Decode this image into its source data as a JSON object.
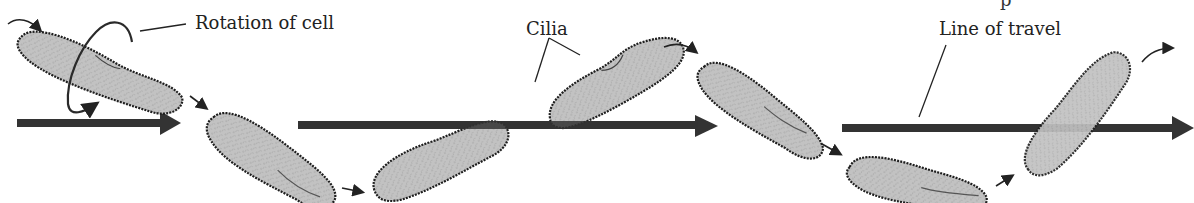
{
  "diagram": {
    "title": "",
    "labels": {
      "rotation": "Rotation of cell",
      "cilia": "Cilia",
      "travel": "Line of travel"
    },
    "truncated_top_text": "p",
    "colors": {
      "cell_fill": "#bdbdbd",
      "cell_outline": "#1e1e1e",
      "arrow": "#333333",
      "background": "#ffffff",
      "text": "#222222"
    },
    "cells": [
      {
        "id": 1,
        "cx": 100,
        "cy": 72,
        "rx": 88,
        "ry": 22,
        "angle": 20
      },
      {
        "id": 2,
        "cx": 272,
        "cy": 160,
        "rx": 72,
        "ry": 25,
        "angle": 30
      },
      {
        "id": 3,
        "cx": 440,
        "cy": 160,
        "rx": 72,
        "ry": 24,
        "angle": -20
      },
      {
        "id": 4,
        "cx": 615,
        "cy": 82,
        "rx": 75,
        "ry": 24,
        "angle": -23
      },
      {
        "id": 5,
        "cx": 762,
        "cy": 110,
        "rx": 72,
        "ry": 24,
        "angle": 32
      },
      {
        "id": 6,
        "cx": 918,
        "cy": 183,
        "rx": 70,
        "ry": 22,
        "angle": 10
      },
      {
        "id": 7,
        "cx": 1076,
        "cy": 113,
        "rx": 74,
        "ry": 27,
        "angle": -47
      }
    ],
    "travel_arrows": [
      {
        "x1": 17,
        "x2": 180,
        "y": 123
      },
      {
        "x1": 298,
        "x2": 716,
        "y": 126
      },
      {
        "x1": 842,
        "x2": 1194,
        "y": 128
      }
    ]
  }
}
